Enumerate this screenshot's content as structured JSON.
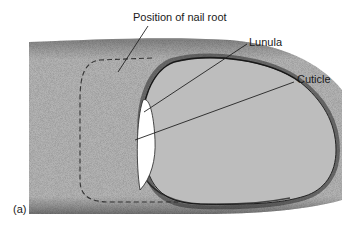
{
  "figure": {
    "panel_label": "(a)",
    "colors": {
      "skin": "#b4b4b4",
      "nail": "#bcbcbc",
      "lunula": "#ffffff",
      "stipple": "#333333",
      "outline": "#222222",
      "leader": "#222222"
    }
  },
  "labels": {
    "nail_root": "Position of nail root",
    "lunula": "Lunula",
    "cuticle": "Cuticle"
  }
}
